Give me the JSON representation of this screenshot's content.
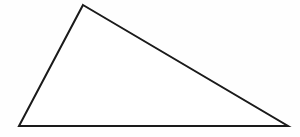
{
  "figure": {
    "kind": "geometry-figure",
    "shape_name": "triangle",
    "classification": "obtuse scalene triangle",
    "caption": "",
    "background_color": "#fefefe",
    "stroke_color": "#1a1a1a",
    "fill_color": "#ffffff",
    "stroke_width": 2,
    "canvas": {
      "width": 300,
      "height": 137
    },
    "labels": [],
    "tick_marks": [],
    "angle_arcs": [],
    "vertices": [
      {
        "name": "apex",
        "x": 83,
        "y": 5,
        "label": ""
      },
      {
        "name": "bottom-right",
        "x": 288,
        "y": 126,
        "label": ""
      },
      {
        "name": "bottom-left",
        "x": 19,
        "y": 126,
        "label": ""
      }
    ],
    "edges": [
      {
        "name": "left-side",
        "from": "apex",
        "to": "bottom-left",
        "label": ""
      },
      {
        "name": "base",
        "from": "bottom-left",
        "to": "bottom-right",
        "label": ""
      },
      {
        "name": "hypotenuse",
        "from": "apex",
        "to": "bottom-right",
        "label": ""
      }
    ],
    "polygon_points": "83,5 288,126 19,126"
  }
}
